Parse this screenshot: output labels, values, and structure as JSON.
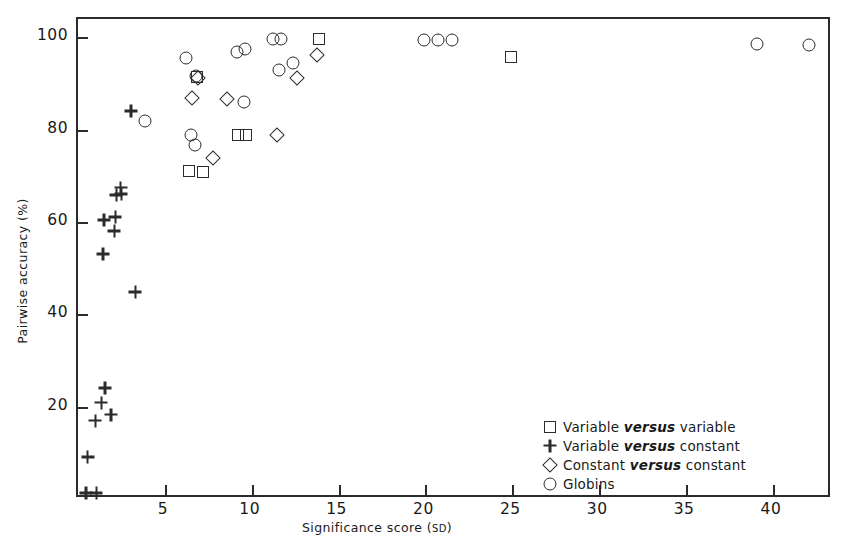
{
  "chart_data": {
    "type": "scatter",
    "title": "",
    "xlabel": "Significance score (SD)",
    "ylabel": "Pairwise accuracy (%)",
    "xlim": [
      0,
      43.4
    ],
    "ylim": [
      0,
      104
    ],
    "grid": false,
    "xticks": [
      5,
      10,
      15,
      20,
      25,
      30,
      35,
      40
    ],
    "yticks": [
      20,
      40,
      60,
      80,
      100
    ],
    "legend_position": "inside lower-right",
    "series": [
      {
        "name": "Variable versus variable",
        "marker": "square",
        "points": [
          [
            6.4,
            71.0
          ],
          [
            7.2,
            70.8
          ],
          [
            6.85,
            91.5
          ],
          [
            9.2,
            78.8
          ],
          [
            9.65,
            78.8
          ],
          [
            13.9,
            99.6
          ],
          [
            24.9,
            95.8
          ]
        ]
      },
      {
        "name": "Variable versus constant",
        "marker": "plus",
        "points": [
          [
            1.0,
            17.0
          ],
          [
            1.35,
            20.9
          ],
          [
            1.45,
            53.0
          ],
          [
            1.5,
            60.4
          ],
          [
            1.55,
            24.0
          ],
          [
            1.9,
            18.2
          ],
          [
            2.1,
            58.0
          ],
          [
            2.15,
            61.0
          ],
          [
            2.2,
            65.8
          ],
          [
            2.45,
            67.4
          ],
          [
            2.5,
            66.0
          ],
          [
            3.05,
            84.0
          ],
          [
            3.3,
            44.8
          ],
          [
            0.45,
            1.2
          ],
          [
            1.05,
            1.2
          ],
          [
            0.55,
            9.0
          ]
        ]
      },
      {
        "name": "Constant versus constant",
        "marker": "diamond",
        "points": [
          [
            6.55,
            86.8
          ],
          [
            6.9,
            91.3
          ],
          [
            7.75,
            73.9
          ],
          [
            8.55,
            86.6
          ],
          [
            11.45,
            78.9
          ],
          [
            12.6,
            91.2
          ],
          [
            13.75,
            96.2
          ]
        ]
      },
      {
        "name": "Globins",
        "marker": "circle",
        "points": [
          [
            3.85,
            81.8
          ],
          [
            6.2,
            95.5
          ],
          [
            6.8,
            91.6
          ],
          [
            6.5,
            78.8
          ],
          [
            6.75,
            76.8
          ],
          [
            9.15,
            96.8
          ],
          [
            9.6,
            97.6
          ],
          [
            9.55,
            86.0
          ],
          [
            11.25,
            99.6
          ],
          [
            11.7,
            99.6
          ],
          [
            11.55,
            93.0
          ],
          [
            12.4,
            94.5
          ],
          [
            19.9,
            99.4
          ],
          [
            20.7,
            99.4
          ],
          [
            21.5,
            99.4
          ],
          [
            39.1,
            98.5
          ],
          [
            42.1,
            98.4
          ]
        ]
      }
    ]
  },
  "legend": {
    "entries": [
      {
        "symbol": "square",
        "pre": "Variable",
        "em": "versus",
        "post": "variable"
      },
      {
        "symbol": "plus",
        "pre": "Variable",
        "em": "versus",
        "post": "constant"
      },
      {
        "symbol": "diamond",
        "pre": "Constant",
        "em": "versus",
        "post": "constant"
      },
      {
        "symbol": "circle",
        "pre": "Globins",
        "em": "",
        "post": ""
      }
    ]
  },
  "colors": {
    "ink": "#2b2b2b",
    "background": "#ffffff"
  }
}
